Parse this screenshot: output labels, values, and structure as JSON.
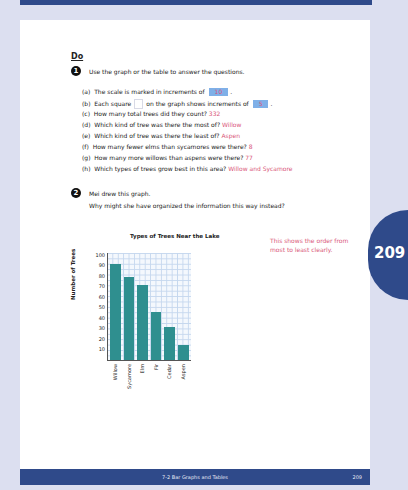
{
  "section_heading": "Do",
  "q1": {
    "number": "1",
    "prompt": "Use the graph or the table to answer the questions.",
    "items": [
      {
        "label": "(a)",
        "text": "The scale is marked in increments of",
        "answer": "10",
        "suffix": "."
      },
      {
        "label": "(b)",
        "text_before": "Each square",
        "text_after": "on the graph shows increments of",
        "answer": "5",
        "suffix": "."
      },
      {
        "label": "(c)",
        "text": "How many total trees did they count?",
        "answer": "332"
      },
      {
        "label": "(d)",
        "text": "Which kind of tree was there the most of?",
        "answer": "Willow"
      },
      {
        "label": "(e)",
        "text": "Which kind of tree was there the least of?",
        "answer": "Aspen"
      },
      {
        "label": "(f)",
        "text": "How many fewer elms than sycamores were there?",
        "answer": "8"
      },
      {
        "label": "(g)",
        "text": "How many more willows than aspens were there?",
        "answer": "77"
      },
      {
        "label": "(h)",
        "text": "Which types of trees grow best in this area?",
        "answer": "Willow and Sycamore"
      }
    ]
  },
  "q2": {
    "number": "2",
    "line1": "Mei drew this graph.",
    "line2": "Why might she have organized the information this way instead?",
    "answer": "This shows the order from most to least clearly."
  },
  "chart_data": {
    "type": "bar",
    "title": "Types of Trees Near the Lake",
    "xlabel": "",
    "ylabel": "Number of Trees",
    "categories": [
      "Willow",
      "Sycamore",
      "Elm",
      "Fir",
      "Cedar",
      "Aspen"
    ],
    "values": [
      91,
      79,
      71,
      46,
      31,
      14
    ],
    "ylim": [
      0,
      100
    ],
    "yticks": [
      10,
      20,
      30,
      40,
      50,
      60,
      70,
      80,
      90,
      100
    ],
    "grid": true,
    "bar_color": "#2f8f8f"
  },
  "side_tab": {
    "page_number": "209"
  },
  "footer": {
    "lesson": "7-2 Bar Graphs and Tables",
    "page_number": "209"
  },
  "colors": {
    "navy": "#2f4a8a",
    "answer_pink": "#d9577a",
    "answer_box_blue": "#7fb0e8",
    "bar_teal": "#2f8f8f"
  }
}
